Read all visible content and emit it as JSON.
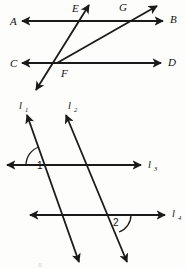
{
  "figure": {
    "background_color": "#fdfdfb",
    "stroke_color": "#1a1a1a",
    "top_diagram": {
      "name": "transversals-through-F",
      "point_labels": [
        {
          "text": "A",
          "x": 10,
          "y": 25
        },
        {
          "text": "E",
          "x": 72,
          "y": 12
        },
        {
          "text": "G",
          "x": 119,
          "y": 11
        },
        {
          "text": "B",
          "x": 170,
          "y": 23
        },
        {
          "text": "C",
          "x": 10,
          "y": 67
        },
        {
          "text": "D",
          "x": 168,
          "y": 66
        },
        {
          "text": "F",
          "x": 61,
          "y": 77
        }
      ],
      "lines": [
        {
          "name": "line-AB",
          "from_label": "A",
          "to_label": "B",
          "y": 21
        },
        {
          "name": "line-CD",
          "from_label": "C",
          "to_label": "D",
          "y": 63
        },
        {
          "name": "transversal-steep-through-E-F",
          "through": [
            "E",
            "F"
          ]
        },
        {
          "name": "ray-F-to-G",
          "through": [
            "F",
            "G"
          ]
        }
      ]
    },
    "bottom_diagram": {
      "name": "parallel-lines-l1-l2-l3-l4",
      "line_labels": [
        {
          "base": "l",
          "sub": "1",
          "x": 19,
          "y": 109
        },
        {
          "base": "l",
          "sub": "2",
          "x": 68,
          "y": 109
        },
        {
          "base": "l",
          "sub": "3",
          "x": 148,
          "y": 168
        },
        {
          "base": "l",
          "sub": "4",
          "x": 176,
          "y": 217
        }
      ],
      "angles": [
        {
          "label": "1",
          "x": 40,
          "y": 168,
          "at": "intersection of l1 and l3"
        },
        {
          "label": "2",
          "x": 115,
          "y": 224,
          "at": "intersection of l2 and l4"
        }
      ],
      "lines": [
        {
          "name": "line-l1",
          "label": "l1",
          "orientation": "transversal-up-left"
        },
        {
          "name": "line-l2",
          "label": "l2",
          "orientation": "transversal-up-left"
        },
        {
          "name": "line-l3",
          "label": "l3",
          "orientation": "horizontal",
          "y": 165
        },
        {
          "name": "line-l4",
          "label": "l4",
          "orientation": "horizontal",
          "y": 215
        }
      ]
    },
    "faint_bottom_mark": "ll"
  }
}
